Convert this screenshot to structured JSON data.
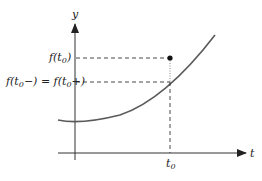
{
  "diagram": {
    "axes": {
      "x_label": "t",
      "y_label": "y"
    },
    "labels": {
      "f_t0": "f(t",
      "f_t0_sub": "0",
      "f_t0_close": ")",
      "limit_eq_prefix": "f(t",
      "limit_eq_sub1": "0",
      "limit_eq_mid": "−) = f(t",
      "limit_eq_sub2": "0",
      "limit_eq_suffix": "+)",
      "t0": "t",
      "t0_sub": "0"
    },
    "colors": {
      "curve": "#5a5a5a",
      "axis": "#333333",
      "dashed": "#333333",
      "point": "#111111"
    }
  }
}
